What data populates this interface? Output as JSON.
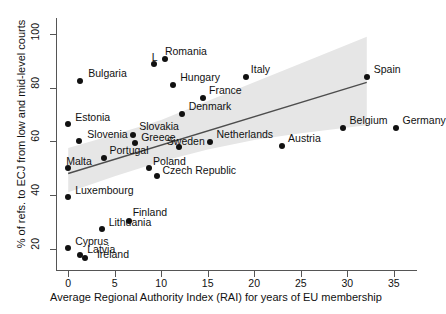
{
  "chart_data": {
    "type": "scatter",
    "title": "",
    "xlabel": "Average Regional Authority Index (RAI) for years of EU membership",
    "ylabel": "% of refs. to ECJ from low and mid-level courts",
    "xlim": [
      -1.2,
      37.5
    ],
    "ylim": [
      12,
      106
    ],
    "xticks": [
      0,
      5,
      10,
      15,
      20,
      25,
      30,
      35
    ],
    "yticks": [
      20,
      40,
      60,
      80,
      100
    ],
    "grid": false,
    "legend": null,
    "point_color": "#111111",
    "fit_line_color": "#4d4d4d",
    "ci_band_color": "#e6e6e6",
    "points": [
      {
        "label": "Cyprus",
        "x": 0.0,
        "y": 20.3,
        "lx": 7,
        "ly": -12
      },
      {
        "label": "Luxembourg",
        "x": 0.0,
        "y": 39.2,
        "lx": 7,
        "ly": -12
      },
      {
        "label": "Malta",
        "x": 0.0,
        "y": 50.0,
        "lx": -2,
        "ly": -12
      },
      {
        "label": "Estonia",
        "x": 0.0,
        "y": 66.3,
        "lx": 7,
        "ly": -12
      },
      {
        "label": "Latvia",
        "x": 1.3,
        "y": 17.6,
        "lx": 7,
        "ly": -11
      },
      {
        "label": "Ireland",
        "x": 1.8,
        "y": 16.6,
        "lx": 12,
        "ly": -9
      },
      {
        "label": "Slovenia",
        "x": 1.2,
        "y": 60.2,
        "lx": 8,
        "ly": -12
      },
      {
        "label": "Bulgaria",
        "x": 1.3,
        "y": 82.6,
        "lx": 8,
        "ly": -13
      },
      {
        "label": "Lithuania",
        "x": 3.6,
        "y": 27.4,
        "lx": 7,
        "ly": -12
      },
      {
        "label": "Portugal",
        "x": 3.9,
        "y": 53.8,
        "lx": 5,
        "ly": -13
      },
      {
        "label": "Finland",
        "x": 6.5,
        "y": 30.1,
        "lx": 4,
        "ly": -14
      },
      {
        "label": "Slovakia",
        "x": 7.0,
        "y": 62.5,
        "lx": 6,
        "ly": -14
      },
      {
        "label": "Greece",
        "x": 7.2,
        "y": 59.3,
        "lx": 6,
        "ly": -11
      },
      {
        "label": "Poland",
        "x": 8.7,
        "y": 49.9,
        "lx": 4,
        "ly": -12
      },
      {
        "label": "Czech Republic",
        "x": 9.5,
        "y": 46.9,
        "lx": 6,
        "ly": -11
      },
      {
        "label": "Latvia2",
        "x": 9.2,
        "y": 89.0,
        "lx": -2,
        "ly": -12
      },
      {
        "label": "Romania",
        "x": 10.4,
        "y": 90.6,
        "lx": 0,
        "ly": -13
      },
      {
        "label": "Hungary",
        "x": 11.3,
        "y": 80.9,
        "lx": 7,
        "ly": -13
      },
      {
        "label": "Denmark",
        "x": 12.2,
        "y": 70.3,
        "lx": 7,
        "ly": -13
      },
      {
        "label": "Sweden",
        "x": 11.9,
        "y": 58.0,
        "lx": -12,
        "ly": -11
      },
      {
        "label": "France",
        "x": 14.5,
        "y": 76.0,
        "lx": 6,
        "ly": -13
      },
      {
        "label": "Netherlands",
        "x": 15.3,
        "y": 59.9,
        "lx": 6,
        "ly": -13
      },
      {
        "label": "Italy",
        "x": 19.1,
        "y": 84.0,
        "lx": 5,
        "ly": -13
      },
      {
        "label": "Austria",
        "x": 23.0,
        "y": 58.2,
        "lx": 6,
        "ly": -13
      },
      {
        "label": "Belgium",
        "x": 29.5,
        "y": 65.0,
        "lx": 7,
        "ly": -13
      },
      {
        "label": "Spain",
        "x": 32.1,
        "y": 84.0,
        "lx": 7,
        "ly": -13
      },
      {
        "label": "Germany",
        "x": 35.2,
        "y": 65.0,
        "lx": 7,
        "ly": -13
      }
    ],
    "fit_line": {
      "x1": 0.0,
      "y1": 48.0,
      "x2": 32.1,
      "y2": 82.0
    },
    "ci_band": {
      "upper": [
        [
          0.0,
          57.5
        ],
        [
          5.0,
          62.5
        ],
        [
          10.0,
          68.0
        ],
        [
          15.0,
          75.0
        ],
        [
          20.0,
          82.0
        ],
        [
          25.0,
          89.0
        ],
        [
          32.1,
          99.0
        ]
      ],
      "lower": [
        [
          0.0,
          41.0
        ],
        [
          5.0,
          47.0
        ],
        [
          10.0,
          52.5
        ],
        [
          15.0,
          57.0
        ],
        [
          20.0,
          60.5
        ],
        [
          25.0,
          63.0
        ],
        [
          32.1,
          66.0
        ]
      ]
    }
  }
}
